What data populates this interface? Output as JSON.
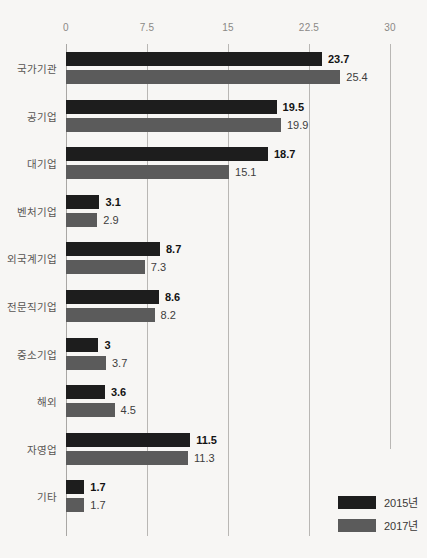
{
  "chart_data": {
    "type": "bar",
    "orientation": "horizontal",
    "title": "",
    "xlabel": "",
    "ylabel": "",
    "xlim": [
      0,
      30
    ],
    "xticks": [
      "0",
      "7.5",
      "15",
      "22.5",
      "30"
    ],
    "xtick_values": [
      0,
      7.5,
      15,
      22.5,
      30
    ],
    "grid": true,
    "legend_position": "bottom-right",
    "categories": [
      "국가기관",
      "공기업",
      "대기업",
      "벤처기업",
      "외국계기업",
      "전문직기업",
      "중소기업",
      "해외",
      "자영업",
      "기타"
    ],
    "series": [
      {
        "name": "2015년",
        "color": "#1d1d1d",
        "values": [
          23.7,
          19.5,
          18.7,
          3.1,
          8.7,
          8.6,
          3,
          3.6,
          11.5,
          1.7
        ],
        "labels": [
          "23.7",
          "19.5",
          "18.7",
          "3.1",
          "8.7",
          "8.6",
          "3",
          "3.6",
          "11.5",
          "1.7"
        ]
      },
      {
        "name": "2017년",
        "color": "#5b5b5b",
        "values": [
          25.4,
          19.9,
          15.1,
          2.9,
          7.3,
          8.2,
          3.7,
          4.5,
          11.3,
          1.7
        ],
        "labels": [
          "25.4",
          "19.9",
          "15.1",
          "2.9",
          "7.3",
          "8.2",
          "3.7",
          "4.5",
          "11.3",
          "1.7"
        ]
      }
    ]
  },
  "legend": {
    "items": [
      {
        "label": "2015년",
        "color": "#1d1d1d"
      },
      {
        "label": "2017년",
        "color": "#5b5b5b"
      }
    ]
  }
}
